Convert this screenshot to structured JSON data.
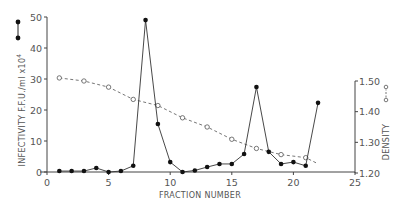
{
  "chart_data": {
    "type": "line",
    "title": "",
    "xlabel": "FRACTION NUMBER",
    "ylabel": "INFECTIVITY F.F.U./ml x10⁴",
    "y2label": "DENSITY",
    "xlim": [
      0,
      25
    ],
    "ylim": [
      0,
      50
    ],
    "y2lim": [
      1.2,
      1.5
    ],
    "grid": false,
    "xticks": [
      0,
      5,
      10,
      15,
      20,
      25
    ],
    "yticks": [
      0,
      10,
      20,
      30,
      40,
      50
    ],
    "y2ticks": [
      "1.20",
      "1.30",
      "1.40",
      "1.50"
    ],
    "series": [
      {
        "name": "Infectivity",
        "axis": "left",
        "marker": "filled-circle",
        "line": "solid",
        "x": [
          1,
          2,
          3,
          4,
          5,
          6,
          7,
          8,
          9,
          10,
          11,
          12,
          13,
          14,
          15,
          16,
          17,
          18,
          19,
          20,
          21,
          22
        ],
        "values": [
          0.3,
          0.3,
          0.3,
          1.3,
          0.0,
          0.3,
          2.0,
          49.0,
          15.5,
          3.2,
          0.0,
          0.5,
          1.6,
          2.6,
          2.6,
          5.8,
          27.4,
          6.5,
          2.6,
          3.2,
          2.0,
          22.3
        ]
      },
      {
        "name": "Density",
        "axis": "right",
        "marker": "open-circle",
        "line": "dashed",
        "x": [
          1,
          3,
          5,
          7,
          9,
          11,
          13,
          15,
          17,
          19,
          21
        ],
        "values": [
          1.51,
          1.5,
          1.48,
          1.44,
          1.42,
          1.38,
          1.35,
          1.31,
          1.28,
          1.26,
          1.25
        ],
        "trend_end": {
          "x": 22,
          "value": 1.23
        }
      }
    ],
    "legend": {
      "left": "filled-circle connected by solid line (infectivity)",
      "right": "open-circle connected by dashed line (density)"
    }
  },
  "labels": {
    "xlabel": "FRACTION NUMBER",
    "ylabel": "INFECTIVITY F.F.U./ml x10",
    "ylabel_exp": "4",
    "y2label": "DENSITY",
    "xticks": [
      "0",
      "5",
      "10",
      "15",
      "20",
      "25"
    ],
    "yticks": [
      "0",
      "10",
      "20",
      "30",
      "40",
      "50"
    ],
    "y2ticks": [
      "1.20",
      "1.30",
      "1.40",
      "1.50"
    ]
  }
}
